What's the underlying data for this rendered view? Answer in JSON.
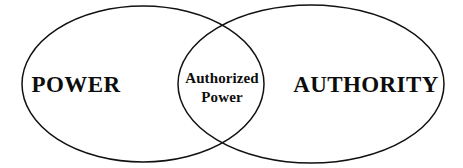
{
  "diagram": {
    "type": "venn",
    "title": "",
    "background_color": "#ffffff",
    "stroke_color": "#111111",
    "text_color": "#0d0d0d",
    "sets": [
      {
        "id": "power",
        "label": "POWER",
        "position": "left",
        "cx": 143,
        "cy": 84,
        "rx": 121,
        "ry": 78
      },
      {
        "id": "authority",
        "label": "AUTHORITY",
        "position": "right",
        "cx": 311,
        "cy": 84,
        "rx": 133,
        "ry": 79
      }
    ],
    "intersection": {
      "id": "authorized-power",
      "label_line_1": "Authorized",
      "label_line_2": "Power",
      "label": "Authorized Power",
      "position": "center"
    }
  }
}
